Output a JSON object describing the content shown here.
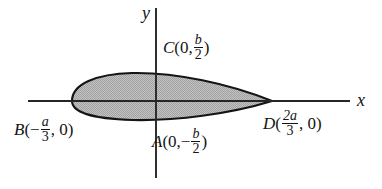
{
  "figure": {
    "background_color": "#ffffff",
    "line_color": "#141414",
    "fill_color": "#b5b5b5",
    "axes": {
      "x_axis_label": "x",
      "y_axis_label": "y",
      "origin_px": [
        156,
        101
      ],
      "x_axis_span_px": [
        28,
        350
      ],
      "y_axis_span_px": [
        8,
        178
      ]
    },
    "shape": {
      "type": "lens-teardrop",
      "left_end_px": [
        72,
        101
      ],
      "right_cusp_px": [
        272,
        101
      ],
      "top_px": 73,
      "bottom_px": 120
    }
  },
  "labels": {
    "point_C": {
      "name": "C",
      "open": "(",
      "x_value": "0,",
      "fraction_num": "b",
      "fraction_den": "2",
      "close": ")",
      "plain": "C(0, b/2)"
    },
    "point_A": {
      "name": "A",
      "open": "(",
      "x_value": "0,",
      "sign": "−",
      "fraction_num": "b",
      "fraction_den": "2",
      "close": ")",
      "plain": "A(0, -b/2)"
    },
    "point_B": {
      "name": "B",
      "open": "(",
      "sign": "−",
      "fraction_num": "a",
      "fraction_den": "3",
      "y_value": ", 0",
      "close": ")",
      "plain": "B(-a/3, 0)"
    },
    "point_D": {
      "name": "D",
      "open": "(",
      "fraction_num": "2a",
      "fraction_den": "3",
      "y_value": ", 0",
      "close": ")",
      "plain": "D(2a/3, 0)"
    },
    "axis_x": "x",
    "axis_y": "y"
  }
}
